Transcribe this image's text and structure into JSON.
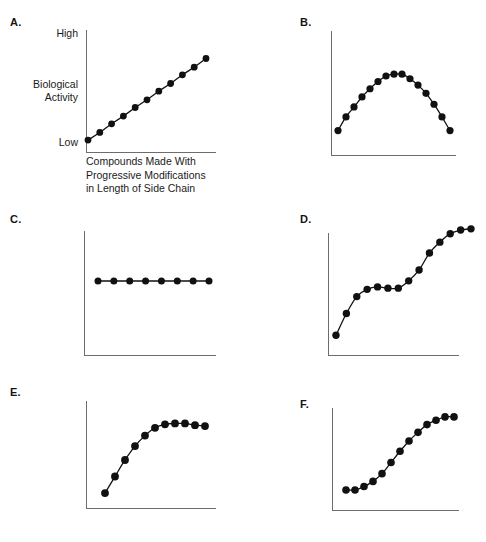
{
  "figure": {
    "title": "",
    "background_color": "#ffffff",
    "ink_color": "#111111",
    "axis_color": "#6d6d6d"
  },
  "axis_labels": {
    "y_high": "High",
    "y_mid_line1": "Biological",
    "y_mid_line2": "Activity",
    "y_low": "Low",
    "x_line1": "Compounds Made With",
    "x_line2": "Progressive Modifications",
    "x_line3": "in Length of Side Chain"
  },
  "panels": {
    "a": {
      "letter": "A."
    },
    "b": {
      "letter": "B."
    },
    "c": {
      "letter": "C."
    },
    "d": {
      "letter": "D."
    },
    "e": {
      "letter": "E."
    },
    "f": {
      "letter": "F."
    }
  },
  "chart_data": [
    {
      "id": "a",
      "type": "line",
      "title": "A.",
      "shape": "linear-increase",
      "xlabel": "Compounds Made With Progressive Modifications in Length of Side Chain",
      "ylabel": "Biological Activity",
      "ytick_labels": [
        "Low",
        "High"
      ],
      "xlim": [
        0,
        10
      ],
      "ylim": [
        0,
        100
      ],
      "grid": false,
      "legend": "none",
      "x": [
        0,
        1,
        2,
        3,
        4,
        5,
        6,
        7,
        8,
        9,
        10
      ],
      "values": [
        3,
        11,
        20,
        28,
        37,
        45,
        54,
        62,
        71,
        79,
        88
      ]
    },
    {
      "id": "b",
      "type": "line",
      "title": "B.",
      "shape": "parabolic-peak",
      "xlabel": "",
      "ylabel": "",
      "xlim": [
        0,
        14
      ],
      "ylim": [
        0,
        100
      ],
      "grid": false,
      "legend": "none",
      "x": [
        0,
        1,
        2,
        3,
        4,
        5,
        6,
        7,
        8,
        9,
        10,
        11,
        12,
        13,
        14
      ],
      "values": [
        18,
        33,
        44,
        55,
        64,
        72,
        78,
        80,
        80,
        75,
        68,
        59,
        47,
        33,
        18
      ]
    },
    {
      "id": "c",
      "type": "line",
      "title": "C.",
      "shape": "flat-constant",
      "xlabel": "",
      "ylabel": "",
      "xlim": [
        0,
        7
      ],
      "ylim": [
        0,
        100
      ],
      "grid": false,
      "legend": "none",
      "x": [
        0,
        1,
        2,
        3,
        4,
        5,
        6,
        7
      ],
      "values": [
        50,
        50,
        50,
        50,
        50,
        50,
        50,
        50
      ]
    },
    {
      "id": "d",
      "type": "line",
      "title": "D.",
      "shape": "double-sigmoid-staircase",
      "xlabel": "",
      "ylabel": "",
      "xlim": [
        0,
        13
      ],
      "ylim": [
        0,
        100
      ],
      "grid": false,
      "legend": "none",
      "x": [
        0,
        1,
        2,
        3,
        4,
        5,
        6,
        7,
        8,
        9,
        10,
        11,
        12,
        13
      ],
      "values": [
        8,
        26,
        40,
        46,
        48,
        47,
        47,
        53,
        62,
        76,
        85,
        92,
        95,
        96
      ]
    },
    {
      "id": "e",
      "type": "line",
      "title": "E.",
      "shape": "saturation-plateau",
      "xlabel": "",
      "ylabel": "",
      "xlim": [
        0,
        10
      ],
      "ylim": [
        0,
        100
      ],
      "grid": false,
      "legend": "none",
      "x": [
        0,
        1,
        2,
        3,
        4,
        5,
        6,
        7,
        8,
        9,
        10
      ],
      "values": [
        8,
        27,
        46,
        62,
        74,
        83,
        87,
        88,
        88,
        86,
        85
      ]
    },
    {
      "id": "f",
      "type": "line",
      "title": "F.",
      "shape": "sigmoid",
      "xlabel": "",
      "ylabel": "",
      "xlim": [
        0,
        12
      ],
      "ylim": [
        0,
        100
      ],
      "grid": false,
      "legend": "none",
      "x": [
        0,
        1,
        2,
        3,
        4,
        5,
        6,
        7,
        8,
        9,
        10,
        11,
        12
      ],
      "values": [
        7,
        7,
        11,
        17,
        26,
        39,
        52,
        64,
        74,
        83,
        88,
        92,
        92
      ]
    }
  ]
}
